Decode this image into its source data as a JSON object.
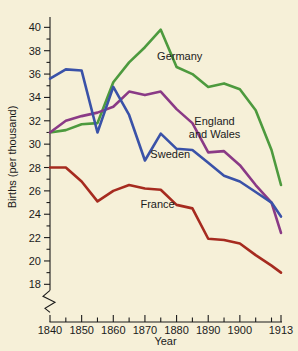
{
  "chart_data": {
    "type": "line",
    "title": "",
    "xlabel": "Year",
    "ylabel": "Births (per thousand)",
    "xlim": [
      1840,
      1913
    ],
    "ylim": [
      17,
      40.8
    ],
    "grid": false,
    "legend_position": "inline-labels",
    "axis_break": true,
    "background_color": "#f6f0d8",
    "x_ticks": [
      1840,
      1845,
      1850,
      1855,
      1860,
      1865,
      1870,
      1875,
      1880,
      1885,
      1890,
      1895,
      1900,
      1905,
      1910,
      1913
    ],
    "x_tick_labels": [
      "1840",
      "",
      "1850",
      "",
      "1860",
      "",
      "1870",
      "",
      "1880",
      "",
      "1890",
      "",
      "1900",
      "",
      "",
      "1913"
    ],
    "y_ticks": [
      18,
      19,
      20,
      21,
      22,
      23,
      24,
      25,
      26,
      27,
      28,
      29,
      30,
      31,
      32,
      33,
      34,
      35,
      36,
      37,
      38,
      39,
      40
    ],
    "y_tick_labels": [
      "18",
      "",
      "20",
      "",
      "22",
      "",
      "24",
      "",
      "26",
      "",
      "28",
      "",
      "30",
      "",
      "32",
      "",
      "34",
      "",
      "36",
      "",
      "38",
      "",
      "40"
    ],
    "x": [
      1840,
      1845,
      1850,
      1855,
      1860,
      1865,
      1870,
      1875,
      1880,
      1885,
      1890,
      1895,
      1900,
      1905,
      1910,
      1913
    ],
    "series": [
      {
        "name": "Germany",
        "color": "#4d9a3e",
        "label": "Germany",
        "label_x": 1881,
        "label_y": 37.2,
        "values": [
          31.0,
          31.2,
          31.7,
          31.8,
          35.3,
          37.0,
          38.3,
          39.8,
          36.6,
          36.0,
          34.9,
          35.2,
          34.7,
          32.9,
          29.5,
          26.5
        ]
      },
      {
        "name": "England and Wales",
        "color": "#8a3a86",
        "label": "England and Wales",
        "label_line_1": "England",
        "label_line_2": "and Wales",
        "label_x": 1892,
        "label_y": 31.6,
        "values": [
          31.0,
          32.0,
          32.4,
          32.7,
          33.2,
          34.5,
          34.2,
          34.5,
          33.0,
          31.8,
          29.3,
          29.4,
          28.2,
          26.5,
          25.0,
          22.4
        ]
      },
      {
        "name": "Sweden",
        "color": "#3a52a8",
        "label": "Sweden",
        "label_x": 1878,
        "label_y": 28.8,
        "values": [
          35.6,
          36.4,
          36.3,
          31.0,
          34.9,
          32.5,
          28.6,
          30.9,
          29.6,
          29.5,
          28.4,
          27.3,
          26.8,
          25.9,
          25.0,
          23.8
        ]
      },
      {
        "name": "France",
        "color": "#a62b1f",
        "label": "France",
        "label_x": 1874,
        "label_y": 24.5,
        "values": [
          28.0,
          28.0,
          26.8,
          25.1,
          26.0,
          26.5,
          26.2,
          26.1,
          24.8,
          24.5,
          21.9,
          21.8,
          21.5,
          20.5,
          19.6,
          19.0
        ]
      }
    ]
  }
}
